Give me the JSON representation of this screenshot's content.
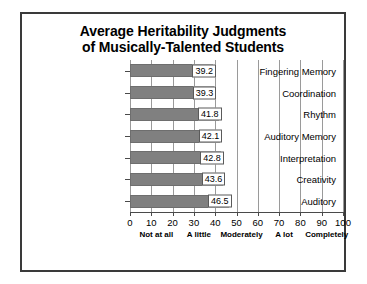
{
  "chart_data": {
    "type": "bar",
    "orientation": "horizontal",
    "title": "Average Heritability Judgments of Musically-Talented Students",
    "title_lines": [
      "Average Heritability Judgments",
      "of Musically-Talented Students"
    ],
    "categories": [
      "Fingering Memory",
      "Coordination",
      "Rhythm",
      "Auditory Memory",
      "Interpretation",
      "Creativity",
      "Auditory"
    ],
    "values": [
      39.2,
      39.3,
      41.8,
      42.1,
      42.8,
      43.6,
      46.5
    ],
    "value_labels": [
      "39.2",
      "39.3",
      "41.8",
      "42.1",
      "42.8",
      "43.6",
      "46.5"
    ],
    "xlabel": "",
    "ylabel": "",
    "xlim": [
      0,
      100
    ],
    "xticks": [
      0,
      10,
      20,
      30,
      40,
      50,
      60,
      70,
      80,
      90,
      100
    ],
    "xtick_labels": [
      "0",
      "10",
      "20",
      "30",
      "40",
      "50",
      "60",
      "70",
      "80",
      "90",
      "100"
    ],
    "scale_anchors": [
      {
        "label": "Not at all",
        "at": 10
      },
      {
        "label": "A little",
        "at": 30
      },
      {
        "label": "Moderately",
        "at": 50
      },
      {
        "label": "A lot",
        "at": 70
      },
      {
        "label": "Completely",
        "at": 90
      }
    ],
    "grid": "vertical",
    "legend": null,
    "colors": {
      "bar_fill": "#808080",
      "bar_stroke": "#6e6e6e",
      "gridline": "#9a9a9a",
      "axis": "#4a4a4a",
      "frame": "#3a3a3a",
      "label_box_bg": "#ffffff",
      "label_box_border": "#5a5a5a",
      "text": "#000000",
      "background": "#ffffff"
    }
  }
}
